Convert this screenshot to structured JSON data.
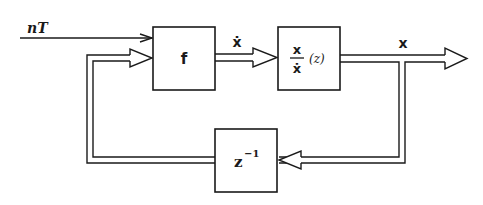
{
  "diagram": {
    "type": "block-diagram",
    "input_signal": {
      "label": "nT"
    },
    "blocks": [
      {
        "id": "f",
        "label": "f"
      },
      {
        "id": "transfer",
        "numerator": "x",
        "denominator": "ẋ",
        "argument": "(z)"
      },
      {
        "id": "delay",
        "base": "z",
        "exponent": "−1"
      }
    ],
    "signals": {
      "f_output": "ẋ",
      "system_output": "x"
    },
    "connections": [
      {
        "from": "input_signal",
        "to": "f",
        "style": "single-arrow"
      },
      {
        "from": "f",
        "to": "transfer",
        "label": "ẋ",
        "style": "double-arrow"
      },
      {
        "from": "transfer",
        "to": "output",
        "label": "x",
        "style": "double-arrow"
      },
      {
        "from": "output-branch",
        "to": "delay",
        "style": "double-arrow"
      },
      {
        "from": "delay",
        "to": "f",
        "style": "double-arrow"
      }
    ],
    "colors": {
      "ink": "#1a1a1a",
      "background": "#ffffff"
    }
  }
}
